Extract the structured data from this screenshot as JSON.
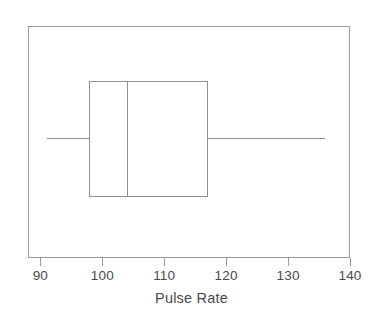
{
  "chart_data": {
    "type": "box",
    "title": "",
    "xlabel": "Pulse Rate",
    "ylabel": "",
    "orientation": "horizontal",
    "xlim": [
      88,
      140
    ],
    "grid": false,
    "legend": false,
    "axis_ticks": [
      {
        "value": 90,
        "label": "90"
      },
      {
        "value": 100,
        "label": "100"
      },
      {
        "value": 110,
        "label": "110"
      },
      {
        "value": 120,
        "label": "120"
      },
      {
        "value": 130,
        "label": "130"
      },
      {
        "value": 140,
        "label": "140"
      }
    ],
    "boxes": [
      {
        "name": "pulse-rate",
        "min": 91,
        "q1": 98,
        "median": 104,
        "q3": 117,
        "max": 136,
        "outliers": []
      }
    ],
    "colors": {
      "line": "#8f8f8f",
      "frame": "#9a9a9a",
      "text": "#4a4a4a",
      "background": "#ffffff"
    }
  },
  "figure": {
    "axis_title": "Pulse Rate"
  }
}
